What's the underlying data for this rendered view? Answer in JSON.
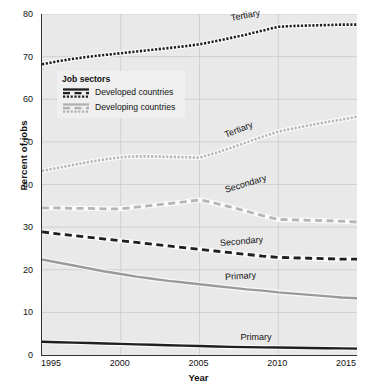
{
  "chart_data": {
    "type": "line",
    "title": "",
    "xlabel": "Year",
    "ylabel": "Percent of jobs",
    "xlim": [
      1995,
      2015
    ],
    "ylim": [
      0,
      80
    ],
    "ytick_step": 10,
    "yticks": [
      0,
      10,
      20,
      30,
      40,
      50,
      60,
      70,
      80
    ],
    "xticks": [
      1995,
      2000,
      2005,
      2010,
      2015
    ],
    "grid": "horizontal-and-vertical",
    "legend": {
      "title": "Job sectors",
      "position": "upper-left-inside",
      "entries": [
        {
          "label": "Developed countries",
          "color": "#1f1f1f"
        },
        {
          "label": "Developing countries",
          "color": "#b0b0b0"
        }
      ]
    },
    "x": [
      1995,
      1996,
      1997,
      1998,
      1999,
      2000,
      2001,
      2002,
      2003,
      2004,
      2005,
      2006,
      2007,
      2008,
      2009,
      2010,
      2011,
      2012,
      2013,
      2014,
      2015
    ],
    "series": [
      {
        "name": "Tertiary",
        "group": "Developed countries",
        "style": "dotted",
        "color": "#1f1f1f",
        "label": "Tertiary",
        "values": [
          68.2,
          68.9,
          69.5,
          70.0,
          70.4,
          70.8,
          71.2,
          71.6,
          72.0,
          72.4,
          72.9,
          73.6,
          74.4,
          75.2,
          76.1,
          77.0,
          77.2,
          77.3,
          77.4,
          77.5,
          77.5
        ]
      },
      {
        "name": "Tertiary",
        "group": "Developing countries",
        "style": "dotted",
        "color": "#b5b5b5",
        "label": "Tertiary",
        "values": [
          43.2,
          43.9,
          44.6,
          45.3,
          45.9,
          46.4,
          46.6,
          46.6,
          46.5,
          46.4,
          46.3,
          47.4,
          48.6,
          49.9,
          51.2,
          52.4,
          53.2,
          53.9,
          54.6,
          55.2,
          55.9
        ]
      },
      {
        "name": "Secondary",
        "group": "Developing countries",
        "style": "dashed",
        "color": "#b5b5b5",
        "label": "Secondary",
        "values": [
          34.5,
          34.5,
          34.4,
          34.4,
          34.3,
          34.3,
          34.7,
          35.1,
          35.5,
          35.9,
          36.4,
          35.6,
          34.7,
          33.7,
          32.7,
          31.8,
          31.7,
          31.6,
          31.5,
          31.4,
          31.2
        ]
      },
      {
        "name": "Secondary",
        "group": "Developed countries",
        "style": "dashed",
        "color": "#1f1f1f",
        "label": "Secondary",
        "values": [
          28.9,
          28.4,
          28.0,
          27.6,
          27.2,
          26.8,
          26.4,
          26.0,
          25.6,
          25.2,
          24.8,
          24.4,
          24.0,
          23.6,
          23.2,
          22.9,
          22.8,
          22.7,
          22.6,
          22.5,
          22.5
        ]
      },
      {
        "name": "Primary",
        "group": "Developing countries",
        "style": "solid",
        "color": "#9a9a9a",
        "label": "Primary",
        "values": [
          22.4,
          21.7,
          21.0,
          20.3,
          19.6,
          19.0,
          18.4,
          17.9,
          17.4,
          17.0,
          16.6,
          16.2,
          15.8,
          15.4,
          15.1,
          14.7,
          14.4,
          14.1,
          13.8,
          13.5,
          13.3
        ]
      },
      {
        "name": "Primary",
        "group": "Developed countries",
        "style": "solid",
        "color": "#1f1f1f",
        "label": "Primary",
        "values": [
          3.1,
          3.0,
          2.9,
          2.8,
          2.7,
          2.6,
          2.5,
          2.4,
          2.3,
          2.2,
          2.1,
          2.0,
          1.9,
          1.85,
          1.8,
          1.75,
          1.7,
          1.65,
          1.6,
          1.55,
          1.5
        ]
      }
    ],
    "annotations": [
      {
        "text": "Tertiary",
        "x": 2007.0,
        "y": 79.0,
        "rotation": -11,
        "series": "Tertiary-developed"
      },
      {
        "text": "Tertiary",
        "x": 2006.6,
        "y": 51.5,
        "rotation": -22,
        "series": "Tertiary-developing"
      },
      {
        "text": "Secondary",
        "x": 2006.6,
        "y": 38.8,
        "rotation": -17,
        "series": "Secondary-developing"
      },
      {
        "text": "Secondary",
        "x": 2006.3,
        "y": 26.3,
        "rotation": -5,
        "series": "Secondary-developed"
      },
      {
        "text": "Primary",
        "x": 2006.6,
        "y": 18.2,
        "rotation": -4,
        "series": "Primary-developing"
      },
      {
        "text": "Primary",
        "x": 2007.6,
        "y": 4.2,
        "rotation": 0,
        "series": "Primary-developed"
      }
    ]
  }
}
